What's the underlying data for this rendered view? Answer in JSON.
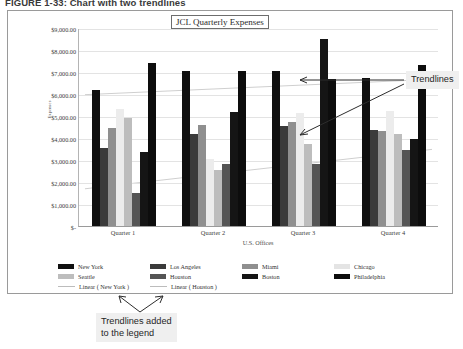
{
  "figure": {
    "caption": "FIGURE 1-33: Chart with two trendlines"
  },
  "chart": {
    "title": "JCL Quarterly Expenses"
  },
  "callouts": {
    "trendlines": "Trendlines",
    "legend_note": "Trendlines added\nto the legend"
  },
  "chart_data": {
    "type": "bar",
    "title": "JCL Quarterly Expenses",
    "xlabel": "U.S. Offices",
    "ylabel": "Expenses",
    "grid": true,
    "legend_position": "bottom",
    "ylim": [
      0,
      9000
    ],
    "ytick_labels": [
      "$9,000.00",
      "$8,000.00",
      "$7,000.00",
      "$6,000.00",
      "$5,000.00",
      "$4,000.00",
      "$3,000.00",
      "$2,000.00",
      "$1,000.00",
      "$-"
    ],
    "ytick_values": [
      9000,
      8000,
      7000,
      6000,
      5000,
      4000,
      3000,
      2000,
      1000,
      0
    ],
    "categories": [
      "Quarter 1",
      "Quarter 2",
      "Quarter 3",
      "Quarter 4"
    ],
    "series": [
      {
        "name": "New York",
        "color": "#101010",
        "values": [
          6200,
          7050,
          7050,
          6750
        ]
      },
      {
        "name": "Los Angeles",
        "color": "#3b3b3b",
        "values": [
          3550,
          4200,
          4550,
          4350
        ]
      },
      {
        "name": "Miami",
        "color": "#8f8f8f",
        "values": [
          4450,
          4600,
          4750,
          4300
        ]
      },
      {
        "name": "Chicago",
        "color": "#ececec",
        "values": [
          5300,
          3050,
          5150,
          5250
        ]
      },
      {
        "name": "Seattle",
        "color": "#bdbdbd",
        "values": [
          4900,
          2550,
          3750,
          4200
        ]
      },
      {
        "name": "Houston",
        "color": "#555555",
        "values": [
          1500,
          2800,
          2800,
          3450
        ]
      },
      {
        "name": "Boston",
        "color": "#151515",
        "values": [
          3350,
          5200,
          8500,
          3950
        ]
      },
      {
        "name": "Philadelphia",
        "color": "#0d0d0d",
        "values": [
          7400,
          7050,
          6700,
          7300
        ]
      }
    ],
    "trendlines": [
      {
        "name": "Linear (New York)",
        "color": "#cfcfcf",
        "start": 6000,
        "end": 6700
      },
      {
        "name": "Linear (Houston)",
        "color": "#cfcfcf",
        "start": 1700,
        "end": 3500
      }
    ],
    "legend_entries": [
      {
        "label": "New York",
        "color": "#101010",
        "kind": "swatch"
      },
      {
        "label": "Los Angeles",
        "color": "#3b3b3b",
        "kind": "swatch"
      },
      {
        "label": "Miami",
        "color": "#8f8f8f",
        "kind": "swatch"
      },
      {
        "label": "Chicago",
        "color": "#e4e4e4",
        "kind": "swatch"
      },
      {
        "label": "Seattle",
        "color": "#bdbdbd",
        "kind": "swatch"
      },
      {
        "label": "Houston",
        "color": "#555555",
        "kind": "swatch"
      },
      {
        "label": "Boston",
        "color": "#151515",
        "kind": "swatch"
      },
      {
        "label": "Philadelphia",
        "color": "#0d0d0d",
        "kind": "swatch"
      },
      {
        "label": "Linear ( New York )",
        "color": "#bcbcbc",
        "kind": "line"
      },
      {
        "label": "Linear ( Houston )",
        "color": "#bcbcbc",
        "kind": "line"
      }
    ]
  }
}
